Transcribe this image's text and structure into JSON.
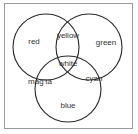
{
  "diagram": {
    "type": "venn",
    "sets": [
      {
        "name": "red-circle",
        "label": "red",
        "cx": 46,
        "cy": 47,
        "r": 33
      },
      {
        "name": "green-circle",
        "label": "green",
        "cx": 89,
        "cy": 47,
        "r": 33
      },
      {
        "name": "blue-circle",
        "label": "blue",
        "cx": 68,
        "cy": 89,
        "r": 33
      }
    ],
    "regions": {
      "red": "red",
      "green": "green",
      "blue": "blue",
      "yellow": "yellow",
      "magenta": "mag'ta",
      "cyan": "cyan",
      "white": "white"
    }
  }
}
